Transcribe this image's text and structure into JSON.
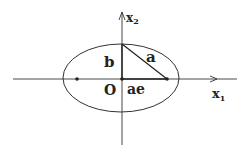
{
  "diagram": {
    "type": "ellipse-geometry",
    "axes": {
      "x_label": "x",
      "x_sub": "1",
      "y_label": "x",
      "y_sub": "2"
    },
    "labels": {
      "origin": "O",
      "semi_minor": "b",
      "semi_major": "a",
      "focal_distance": "ae"
    },
    "points": [
      "left-focus",
      "center",
      "right-focus"
    ],
    "colors": {
      "stroke": "#333333",
      "background": "#ffffff"
    }
  }
}
